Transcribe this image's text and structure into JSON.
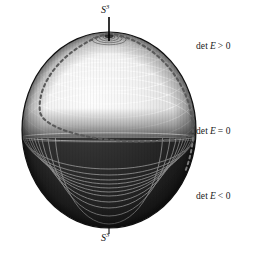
{
  "figure": {
    "type": "sphere-diagram",
    "background": "#ffffff",
    "sphere": {
      "center_x": 109,
      "center_y": 130,
      "radius_x": 87,
      "radius_y": 98,
      "outline_color": "#111111",
      "upper_hemisphere_tone": "#e8e8e8",
      "lower_hemisphere_tone": "#262626",
      "equator_y": 138
    },
    "poles": {
      "north": {
        "label": "S",
        "superscript": "3",
        "tick_color": "#000000"
      },
      "south": {
        "label": "S",
        "superscript": "3",
        "tick_color": "#000000"
      }
    },
    "dashed_meridian": {
      "color": "#555555",
      "style": "dashed"
    },
    "contour_lines": {
      "color_upper": "#ffffff",
      "color_lower": "#b9b9b9"
    }
  },
  "labels": {
    "det_positive": {
      "prefix": "det",
      "symbol": "E",
      "relation": "> 0",
      "full": "det E > 0"
    },
    "det_zero": {
      "prefix": "det",
      "symbol": "E",
      "relation": "= 0",
      "full": "det E = 0"
    },
    "det_negative": {
      "prefix": "det",
      "symbol": "E",
      "relation": "< 0",
      "full": "det E < 0"
    },
    "pole_top": {
      "symbol": "S",
      "superscript": "3"
    },
    "pole_bottom": {
      "symbol": "S",
      "superscript": "3"
    }
  }
}
